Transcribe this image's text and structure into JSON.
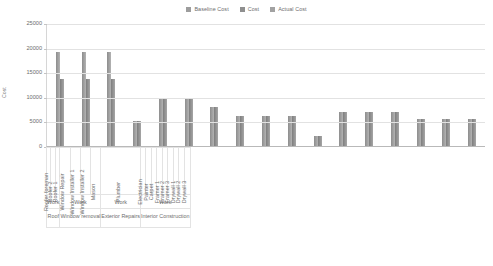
{
  "legend": {
    "position": "top-center",
    "items": [
      {
        "label": "Baseline Cost",
        "color": "#9d9d9d",
        "icon": "legend-swatch"
      },
      {
        "label": "Cost",
        "color": "#8f8f8f",
        "icon": "legend-swatch"
      },
      {
        "label": "Actual Cost",
        "color": "#a2a2a2",
        "icon": "legend-swatch"
      }
    ]
  },
  "axis": {
    "ylabel": "Cost",
    "yticks": [
      "25000",
      "20000",
      "15000",
      "10000",
      "5000",
      "0"
    ]
  },
  "groups": [
    {
      "work": "Work",
      "name": "Roof",
      "span": 3
    },
    {
      "work": "Work",
      "name": "Window removal",
      "span": 4
    },
    {
      "work": "Work",
      "name": "Exterior Repairs",
      "span": 1
    },
    {
      "work": "Work",
      "name": "Interior Construction",
      "span": 9
    }
  ],
  "chart_data": {
    "type": "bar",
    "title": "",
    "xlabel": "",
    "ylabel": "Cost",
    "ylim": [
      0,
      25000
    ],
    "ytick_step": 5000,
    "grid": true,
    "legend_position": "top-center",
    "categories": [
      "Roofer foreman",
      "Roofer 2",
      "Roofer 1",
      "Window Repair",
      "Window Installer 1",
      "Window Installer 2",
      "Mason",
      "Plumber",
      "Electrician",
      "Painter",
      "Carpet",
      "Framer 1",
      "Framer 2",
      "Framer 3",
      "Drywall 1",
      "Drywall 2",
      "Drywall 3"
    ],
    "series": [
      {
        "name": "Baseline Cost",
        "color": "#9d9d9d",
        "values": [
          19200,
          19200,
          19200,
          5000,
          9500,
          9500,
          8000,
          6000,
          6000,
          6000,
          2000,
          7000,
          7000,
          7000,
          5500,
          5500,
          5500
        ]
      },
      {
        "name": "Cost",
        "color": "#8f8f8f",
        "values": [
          13700,
          13700,
          13700,
          5000,
          9500,
          9500,
          8000,
          6000,
          6000,
          6000,
          2000,
          7000,
          7000,
          7000,
          5500,
          5500,
          5500
        ]
      },
      {
        "name": "Actual Cost",
        "color": "#a2a2a2",
        "values": [
          0,
          0,
          0,
          0,
          0,
          0,
          0,
          0,
          0,
          0,
          0,
          0,
          0,
          0,
          0,
          0,
          0
        ]
      }
    ]
  }
}
